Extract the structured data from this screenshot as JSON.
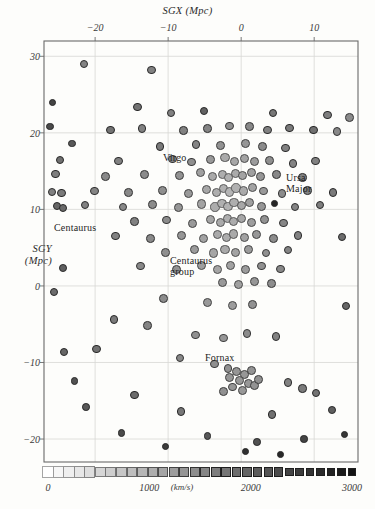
{
  "figure": {
    "caption_type": "scatter",
    "background": "#fdfdfb"
  },
  "axes": {
    "x_title": "SGX (Mpc)",
    "y_title_line1": "SGY",
    "y_title_line2": "(Mpc)",
    "x_ticks": [
      {
        "label": "−20",
        "value": -20
      },
      {
        "label": "−10",
        "value": -10
      },
      {
        "label": "0",
        "value": 0
      },
      {
        "label": "10",
        "value": 10
      }
    ],
    "y_ticks": [
      {
        "label": "30",
        "value": 30
      },
      {
        "label": "20",
        "value": 20
      },
      {
        "label": "10",
        "value": 10
      },
      {
        "label": "0",
        "value": 0
      },
      {
        "label": "−10",
        "value": -10
      },
      {
        "label": "−20",
        "value": -20
      }
    ],
    "frame_color": "#6a6a6a",
    "grid_color": "#d8d8d4"
  },
  "annotations": [
    {
      "name": "virgo",
      "text": "Virgo",
      "x": 163,
      "y": 152
    },
    {
      "name": "ursa-major",
      "text_line1": "Ursa",
      "text_line2": "Major",
      "x": 286,
      "y": 172
    },
    {
      "name": "centaurus",
      "text": "Centaurus",
      "x": 54,
      "y": 222
    },
    {
      "name": "centaurus-group",
      "text_line1": "Centaurus",
      "text_line2": "group",
      "x": 170,
      "y": 255
    },
    {
      "name": "fornax",
      "text": "Fornax",
      "x": 205,
      "y": 352
    }
  ],
  "colorbar": {
    "units": "(km/s)",
    "ticks": [
      {
        "label": "0",
        "value": 0
      },
      {
        "label": "1000",
        "value": 1000
      },
      {
        "label": "2000",
        "value": 2000
      },
      {
        "label": "3000",
        "value": 3000
      }
    ],
    "range_min": 0,
    "range_max": 3000,
    "swatch_count": 30,
    "light_color": "#ffffff",
    "dark_color": "#1a1a1a"
  },
  "chart_data": {
    "type": "scatter",
    "title": "",
    "xlabel": "SGX (Mpc)",
    "ylabel": "SGY (Mpc)",
    "xlim": [
      -27,
      16
    ],
    "ylim": [
      -23,
      32
    ],
    "grid": true,
    "legend": "colorbar velocity (km/s) 0-3000",
    "color_meaning": "recession velocity, km/s; lighter/larger = low velocity, darker/smaller = high velocity",
    "points": [
      [
        -21.5,
        29.0,
        1450
      ],
      [
        -12.3,
        28.2,
        1500
      ],
      [
        -25.8,
        24.0,
        2400
      ],
      [
        -14.2,
        23.4,
        1700
      ],
      [
        -9.6,
        22.6,
        1500
      ],
      [
        -5.1,
        22.9,
        1950
      ],
      [
        4.4,
        22.6,
        1650
      ],
      [
        11.8,
        22.3,
        1550
      ],
      [
        14.8,
        22.0,
        1350
      ],
      [
        -17.9,
        20.4,
        1700
      ],
      [
        -13.6,
        20.6,
        1500
      ],
      [
        -7.9,
        20.3,
        1500
      ],
      [
        -4.6,
        20.6,
        1450
      ],
      [
        -1.6,
        20.9,
        1300
      ],
      [
        1.1,
        20.8,
        1400
      ],
      [
        3.6,
        20.4,
        1500
      ],
      [
        6.6,
        20.6,
        1600
      ],
      [
        9.9,
        20.4,
        1750
      ],
      [
        13.1,
        20.2,
        1400
      ],
      [
        -23.2,
        18.6,
        2100
      ],
      [
        -11.1,
        18.2,
        1600
      ],
      [
        -6.2,
        18.5,
        1450
      ],
      [
        -2.8,
        18.3,
        1250
      ],
      [
        0.6,
        18.6,
        1200
      ],
      [
        2.9,
        18.2,
        1350
      ],
      [
        6.1,
        18.0,
        1500
      ],
      [
        -24.8,
        16.5,
        1750
      ],
      [
        -16.8,
        16.3,
        1500
      ],
      [
        -9.4,
        16.6,
        1400
      ],
      [
        -6.8,
        16.2,
        1300
      ],
      [
        -4.2,
        16.5,
        1150
      ],
      [
        -2.2,
        16.8,
        900
      ],
      [
        -0.9,
        16.3,
        950
      ],
      [
        0.4,
        16.6,
        1000
      ],
      [
        1.8,
        16.2,
        1100
      ],
      [
        3.9,
        16.4,
        1300
      ],
      [
        7.1,
        16.0,
        1450
      ],
      [
        10.2,
        16.3,
        1500
      ],
      [
        -25.4,
        14.6,
        1550
      ],
      [
        -18.6,
        14.3,
        1400
      ],
      [
        -13.2,
        14.6,
        1350
      ],
      [
        -8.4,
        14.4,
        1250
      ],
      [
        -5.6,
        14.8,
        1050
      ],
      [
        -3.9,
        14.3,
        900
      ],
      [
        -2.6,
        14.6,
        850
      ],
      [
        -1.7,
        14.2,
        800
      ],
      [
        -0.8,
        14.7,
        900
      ],
      [
        0.2,
        14.4,
        1000
      ],
      [
        1.4,
        14.8,
        1050
      ],
      [
        2.6,
        14.3,
        1200
      ],
      [
        4.8,
        14.6,
        1400
      ],
      [
        8.4,
        14.2,
        1500
      ],
      [
        -25.9,
        12.3,
        1500
      ],
      [
        -24.6,
        12.1,
        1600
      ],
      [
        -20.1,
        12.4,
        1450
      ],
      [
        -15.4,
        12.2,
        1400
      ],
      [
        -10.8,
        12.5,
        1300
      ],
      [
        -7.2,
        12.1,
        1150
      ],
      [
        -4.8,
        12.6,
        950
      ],
      [
        -3.4,
        12.2,
        850
      ],
      [
        -2.4,
        12.7,
        800
      ],
      [
        -1.6,
        12.3,
        750
      ],
      [
        -0.7,
        12.8,
        820
      ],
      [
        0.3,
        12.4,
        900
      ],
      [
        1.6,
        12.9,
        1000
      ],
      [
        3.1,
        12.4,
        1150
      ],
      [
        5.6,
        12.1,
        1350
      ],
      [
        9.1,
        12.5,
        1500
      ],
      [
        12.6,
        12.2,
        1600
      ],
      [
        -25.2,
        10.4,
        1900
      ],
      [
        -24.4,
        10.2,
        1850
      ],
      [
        -21.4,
        10.6,
        1500
      ],
      [
        -16.2,
        10.3,
        1400
      ],
      [
        -12.1,
        10.6,
        1350
      ],
      [
        -8.6,
        10.2,
        1200
      ],
      [
        -5.4,
        10.7,
        1000
      ],
      [
        -3.6,
        10.3,
        880
      ],
      [
        -2.6,
        10.8,
        820
      ],
      [
        -1.8,
        10.4,
        780
      ],
      [
        -1.0,
        10.9,
        850
      ],
      [
        0.0,
        10.5,
        950
      ],
      [
        1.2,
        10.9,
        1050
      ],
      [
        2.8,
        10.4,
        1200
      ],
      [
        4.6,
        10.8,
        2850
      ],
      [
        7.4,
        10.3,
        1450
      ],
      [
        10.8,
        10.6,
        1550
      ],
      [
        -14.6,
        8.4,
        1500
      ],
      [
        -10.2,
        8.6,
        1350
      ],
      [
        -6.6,
        8.2,
        1150
      ],
      [
        -4.2,
        8.7,
        980
      ],
      [
        -2.8,
        8.3,
        900
      ],
      [
        -1.9,
        8.8,
        840
      ],
      [
        -1.0,
        8.4,
        880
      ],
      [
        0.1,
        8.8,
        960
      ],
      [
        1.4,
        8.3,
        1080
      ],
      [
        3.2,
        8.7,
        1250
      ],
      [
        5.8,
        8.2,
        1420
      ],
      [
        -17.2,
        6.5,
        1500
      ],
      [
        -12.4,
        6.2,
        1380
      ],
      [
        -8.2,
        6.6,
        1200
      ],
      [
        -5.2,
        6.2,
        1020
      ],
      [
        -3.2,
        6.7,
        900
      ],
      [
        -2.0,
        6.3,
        860
      ],
      [
        -1.0,
        6.8,
        920
      ],
      [
        0.4,
        6.3,
        1020
      ],
      [
        2.1,
        6.7,
        1180
      ],
      [
        4.4,
        6.2,
        1350
      ],
      [
        7.8,
        6.6,
        1500
      ],
      [
        -10.4,
        4.4,
        1300
      ],
      [
        -6.4,
        4.8,
        1120
      ],
      [
        -3.8,
        4.3,
        980
      ],
      [
        -2.2,
        4.8,
        920
      ],
      [
        -0.8,
        4.4,
        1000
      ],
      [
        1.0,
        4.8,
        1120
      ],
      [
        3.4,
        4.3,
        1280
      ],
      [
        6.4,
        4.7,
        1450
      ],
      [
        -13.8,
        2.6,
        1400
      ],
      [
        -8.8,
        2.2,
        1250
      ],
      [
        -5.4,
        2.7,
        1080
      ],
      [
        -3.2,
        2.2,
        980
      ],
      [
        -1.4,
        2.7,
        1020
      ],
      [
        0.6,
        2.2,
        1120
      ],
      [
        2.8,
        2.6,
        1280
      ],
      [
        5.4,
        2.2,
        1400
      ],
      [
        -2.6,
        0.4,
        1150
      ],
      [
        -0.4,
        0.2,
        1050
      ],
      [
        1.8,
        0.6,
        1200
      ],
      [
        4.2,
        0.3,
        1320
      ],
      [
        -25.6,
        -0.8,
        1800
      ],
      [
        -10.6,
        -1.6,
        1350
      ],
      [
        -4.6,
        -2.2,
        1150
      ],
      [
        -1.2,
        -2.6,
        1080
      ],
      [
        1.6,
        -2.4,
        1250
      ],
      [
        -17.4,
        -4.4,
        1600
      ],
      [
        -12.8,
        -5.2,
        1450
      ],
      [
        -6.2,
        -6.4,
        1280
      ],
      [
        -2.4,
        -6.8,
        1200
      ],
      [
        0.8,
        -6.2,
        1350
      ],
      [
        4.8,
        -6.6,
        1500
      ],
      [
        -24.2,
        -8.6,
        1900
      ],
      [
        -19.8,
        -8.2,
        1750
      ],
      [
        -8.4,
        -9.4,
        1400
      ],
      [
        -3.6,
        -10.2,
        1300
      ],
      [
        -1.8,
        -10.8,
        1250
      ],
      [
        -0.6,
        -11.2,
        1200
      ],
      [
        0.4,
        -11.6,
        1180
      ],
      [
        1.4,
        -11.0,
        1220
      ],
      [
        -0.2,
        -12.4,
        1150
      ],
      [
        1.0,
        -12.8,
        1180
      ],
      [
        -1.2,
        -13.2,
        1200
      ],
      [
        0.2,
        -13.6,
        1160
      ],
      [
        1.8,
        -13.0,
        1240
      ],
      [
        -1.6,
        -12.0,
        1190
      ],
      [
        2.4,
        -12.2,
        1280
      ],
      [
        -2.4,
        -13.8,
        1260
      ],
      [
        6.4,
        -12.6,
        1500
      ],
      [
        8.4,
        -13.4,
        1600
      ],
      [
        10.2,
        -14.0,
        1700
      ],
      [
        -14.6,
        -14.2,
        1800
      ],
      [
        -21.2,
        -15.8,
        2100
      ],
      [
        -8.2,
        -16.4,
        1650
      ],
      [
        4.2,
        -16.8,
        1750
      ],
      [
        12.4,
        -16.2,
        2000
      ],
      [
        -16.4,
        -19.2,
        2300
      ],
      [
        -4.6,
        -19.6,
        2100
      ],
      [
        2.2,
        -20.4,
        2200
      ],
      [
        8.6,
        -20.0,
        2400
      ],
      [
        14.2,
        -19.4,
        2600
      ],
      [
        -10.4,
        -21.0,
        2500
      ],
      [
        0.6,
        -21.6,
        2700
      ],
      [
        5.4,
        -22.0,
        2800
      ],
      [
        -24.4,
        2.4,
        2000
      ],
      [
        -22.8,
        -12.4,
        2200
      ],
      [
        13.8,
        6.4,
        1800
      ],
      [
        14.4,
        -2.6,
        1900
      ],
      [
        -26.2,
        20.8,
        2300
      ]
    ]
  }
}
